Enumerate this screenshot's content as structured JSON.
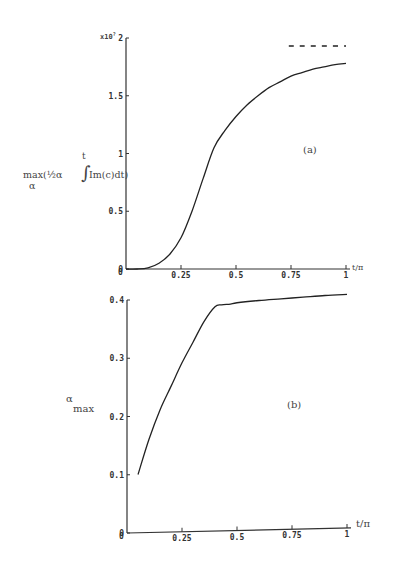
{
  "chart_data": [
    {
      "id": "a",
      "type": "line",
      "panel_label": "(a)",
      "title": "",
      "xlabel": "t/π",
      "ylabel": "max(½α ∫^t Im(c)dt) over α",
      "ylabel_parts": {
        "main": "max(½α",
        "integral_upper": "t",
        "integrand": "Im(c)dt)",
        "sub": "α"
      },
      "y_multiplier": "x10^?",
      "xlim": [
        0,
        1
      ],
      "ylim": [
        0,
        2
      ],
      "xticks": [
        "0",
        "0.25",
        "0.5",
        "0.75",
        "1"
      ],
      "yticks": [
        "0",
        "0.5",
        "1",
        "1.5",
        "2"
      ],
      "grid": false,
      "series": [
        {
          "name": "solution",
          "style": "solid",
          "x": [
            0,
            0.05,
            0.1,
            0.15,
            0.2,
            0.25,
            0.3,
            0.35,
            0.4,
            0.45,
            0.5,
            0.55,
            0.6,
            0.65,
            0.7,
            0.75,
            0.8,
            0.85,
            0.9,
            0.95,
            1.0
          ],
          "y": [
            0,
            0.0,
            0.01,
            0.05,
            0.13,
            0.27,
            0.5,
            0.78,
            1.05,
            1.2,
            1.32,
            1.42,
            1.5,
            1.57,
            1.62,
            1.67,
            1.7,
            1.73,
            1.75,
            1.77,
            1.78
          ]
        },
        {
          "name": "asymptote",
          "style": "dashed",
          "x": [
            0.74,
            1.0
          ],
          "y": [
            1.93,
            1.93
          ]
        }
      ]
    },
    {
      "id": "b",
      "type": "line",
      "panel_label": "(b)",
      "title": "",
      "xlabel": "t/π",
      "ylabel": "α max",
      "ylabel_parts": {
        "main": "α",
        "sub": "max"
      },
      "xlim": [
        0,
        1
      ],
      "ylim": [
        0,
        0.4
      ],
      "xticks": [
        "0",
        "0.25",
        "0.5",
        "0.75",
        "1"
      ],
      "yticks": [
        "0",
        "0.1",
        "0.2",
        "0.3",
        "0.4"
      ],
      "grid": false,
      "series": [
        {
          "name": "alpha_max",
          "style": "solid",
          "x": [
            0.05,
            0.1,
            0.15,
            0.2,
            0.25,
            0.3,
            0.35,
            0.4,
            0.43,
            0.47,
            0.5,
            0.6,
            0.7,
            0.8,
            0.9,
            1.0
          ],
          "y": [
            0.1,
            0.16,
            0.21,
            0.25,
            0.29,
            0.325,
            0.36,
            0.385,
            0.388,
            0.389,
            0.391,
            0.394,
            0.396,
            0.398,
            0.4,
            0.401
          ]
        }
      ]
    }
  ],
  "labels": {
    "a_panel": "(a)",
    "b_panel": "(b)",
    "a_xlabel": "t/π",
    "b_xlabel": "t/π",
    "a_multiplier": "x10",
    "a_multiplier_exp": "?",
    "a_ylabel_main": "max(½α",
    "a_ylabel_upper": "t",
    "a_ylabel_integrand": "Im(c)dt)",
    "a_ylabel_sub": "α",
    "b_ylabel_main": "α",
    "b_ylabel_sub": "max"
  }
}
